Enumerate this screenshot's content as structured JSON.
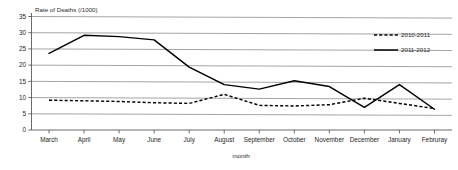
{
  "chart_data": {
    "type": "line",
    "title": "Rate of Deaths (/1000)",
    "xlabel": "month",
    "ylabel": "",
    "ylim": [
      0,
      35
    ],
    "yticks": [
      0,
      5,
      10,
      15,
      20,
      25,
      30,
      35
    ],
    "grid": true,
    "legend_position": "top-right",
    "categories": [
      "March",
      "April",
      "May",
      "June",
      "July",
      "August",
      "September",
      "October",
      "November",
      "December",
      "January",
      "Februray"
    ],
    "series": [
      {
        "name": "2010-2011",
        "style": "dashed",
        "color": "#000000",
        "values": [
          9.2,
          9.0,
          8.8,
          8.4,
          8.2,
          11.0,
          7.6,
          7.4,
          7.8,
          9.8,
          8.2,
          6.6
        ]
      },
      {
        "name": "2011-2012",
        "style": "solid",
        "color": "#000000",
        "values": [
          23.6,
          29.2,
          28.8,
          27.8,
          19.4,
          14.0,
          12.6,
          15.2,
          13.4,
          7.0,
          14.0,
          6.4
        ]
      }
    ]
  },
  "legend": {
    "entries": [
      {
        "label": "2010-2011"
      },
      {
        "label": "2011-2012"
      }
    ]
  },
  "axis": {
    "y_tick_labels": [
      "0",
      "5",
      "10",
      "15",
      "20",
      "25",
      "30",
      "35"
    ],
    "x_tick_labels": [
      "March",
      "April",
      "May",
      "June",
      "July",
      "August",
      "September",
      "October",
      "November",
      "December",
      "January",
      "Februray"
    ]
  }
}
